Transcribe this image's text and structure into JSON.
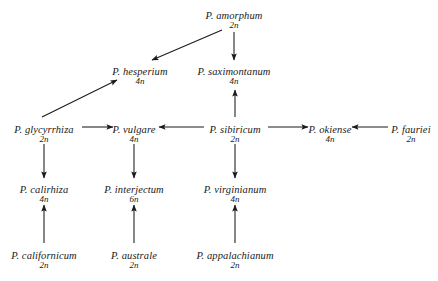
{
  "diagram": {
    "type": "directed-graph",
    "background": "#ffffff",
    "line_color": "#1a1a1a",
    "text_color": "#1a1a1a",
    "nodes": [
      {
        "id": "amorphum",
        "species": "P. amorphum",
        "ploidy": "2n",
        "x": 234,
        "y": 10
      },
      {
        "id": "hesperium",
        "species": "P. hesperium",
        "ploidy": "4n",
        "x": 140,
        "y": 66
      },
      {
        "id": "saximontanum",
        "species": "P. saximontanum",
        "ploidy": "4n",
        "x": 234,
        "y": 66
      },
      {
        "id": "glycyrrhiza",
        "species": "P. glycyrrhiza",
        "ploidy": "2n",
        "x": 44,
        "y": 124
      },
      {
        "id": "vulgare",
        "species": "P. vulgare",
        "ploidy": "4n",
        "x": 134,
        "y": 124
      },
      {
        "id": "sibiricum",
        "species": "P. sibiricum",
        "ploidy": "2n",
        "x": 235,
        "y": 124
      },
      {
        "id": "okiense",
        "species": "P. okiense",
        "ploidy": "4n",
        "x": 330,
        "y": 124
      },
      {
        "id": "fauriei",
        "species": "P. fauriei",
        "ploidy": "2n",
        "x": 411,
        "y": 124
      },
      {
        "id": "calirhiza",
        "species": "P. calirhiza",
        "ploidy": "4n",
        "x": 44,
        "y": 184
      },
      {
        "id": "interjectum",
        "species": "P. interjectum",
        "ploidy": "6n",
        "x": 134,
        "y": 184
      },
      {
        "id": "virginianum",
        "species": "P. virginianum",
        "ploidy": "4n",
        "x": 235,
        "y": 184
      },
      {
        "id": "californicum",
        "species": "P. californicum",
        "ploidy": "2n",
        "x": 44,
        "y": 250
      },
      {
        "id": "australe",
        "species": "P. australe",
        "ploidy": "2n",
        "x": 134,
        "y": 250
      },
      {
        "id": "appalachianum",
        "species": "P. appalachianum",
        "ploidy": "2n",
        "x": 235,
        "y": 250
      }
    ],
    "edges": [
      {
        "from": "amorphum",
        "to": "hesperium",
        "arrow": true,
        "x1": 222,
        "y1": 30,
        "x2": 152,
        "y2": 60
      },
      {
        "from": "amorphum",
        "to": "saximontanum",
        "arrow": true,
        "x1": 234,
        "y1": 32,
        "x2": 234,
        "y2": 60
      },
      {
        "from": "glycyrrhiza",
        "to": "hesperium",
        "arrow": true,
        "x1": 42,
        "y1": 117,
        "x2": 117,
        "y2": 80
      },
      {
        "from": "glycyrrhiza",
        "to": "vulgare",
        "arrow": true,
        "x1": 82,
        "y1": 127,
        "x2": 113,
        "y2": 127
      },
      {
        "from": "sibiricum",
        "to": "vulgare",
        "arrow": true,
        "x1": 204,
        "y1": 127,
        "x2": 159,
        "y2": 127
      },
      {
        "from": "sibiricum",
        "to": "okiense",
        "arrow": true,
        "x1": 268,
        "y1": 127,
        "x2": 308,
        "y2": 127
      },
      {
        "from": "fauriei",
        "to": "okiense",
        "arrow": true,
        "x1": 388,
        "y1": 127,
        "x2": 352,
        "y2": 127
      },
      {
        "from": "sibiricum",
        "to": "saximontanum",
        "arrow": true,
        "x1": 235,
        "y1": 117,
        "x2": 235,
        "y2": 90
      },
      {
        "from": "glycyrrhiza",
        "to": "calirhiza",
        "arrow": true,
        "x1": 44,
        "y1": 144,
        "x2": 44,
        "y2": 178
      },
      {
        "from": "vulgare",
        "to": "interjectum",
        "arrow": true,
        "x1": 134,
        "y1": 144,
        "x2": 134,
        "y2": 178
      },
      {
        "from": "sibiricum",
        "to": "virginianum",
        "arrow": true,
        "x1": 235,
        "y1": 144,
        "x2": 235,
        "y2": 178
      },
      {
        "from": "californicum",
        "to": "calirhiza",
        "arrow": true,
        "x1": 44,
        "y1": 243,
        "x2": 44,
        "y2": 205
      },
      {
        "from": "australe",
        "to": "interjectum",
        "arrow": true,
        "x1": 134,
        "y1": 243,
        "x2": 134,
        "y2": 205
      },
      {
        "from": "appalachianum",
        "to": "virginianum",
        "arrow": true,
        "x1": 235,
        "y1": 243,
        "x2": 235,
        "y2": 205
      }
    ]
  }
}
